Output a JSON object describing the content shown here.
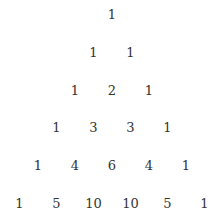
{
  "rows": [
    [
      "1"
    ],
    [
      "1",
      "1"
    ],
    [
      "1",
      "2",
      "1"
    ],
    [
      "1",
      "3",
      "3",
      "1"
    ],
    [
      "1",
      "4",
      "6",
      "4",
      "1"
    ],
    [
      "1",
      "5",
      "10",
      "10",
      "5",
      "1"
    ]
  ],
  "layout": {
    "center_x": 112,
    "top_y": 14,
    "row_gap": 37.8,
    "col_gap": 37
  }
}
